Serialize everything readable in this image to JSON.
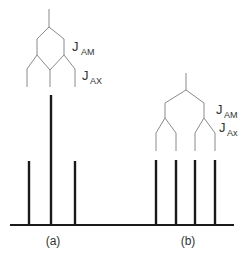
{
  "figure": {
    "panels": [
      {
        "id": "a",
        "caption": "(a)",
        "splitting_labels": [
          {
            "main": "J",
            "sub": "AM"
          },
          {
            "main": "J",
            "sub": "AX"
          }
        ],
        "lines": [
          {
            "x": 29,
            "relative_intensity": 1
          },
          {
            "x": 51,
            "relative_intensity": 2
          },
          {
            "x": 75,
            "relative_intensity": 1
          }
        ]
      },
      {
        "id": "b",
        "caption": "(b)",
        "splitting_labels": [
          {
            "main": "J",
            "sub": "AM"
          },
          {
            "main": "J",
            "sub": "Ax"
          }
        ],
        "lines": [
          {
            "x": 156,
            "relative_intensity": 1
          },
          {
            "x": 176,
            "relative_intensity": 1
          },
          {
            "x": 195,
            "relative_intensity": 1
          },
          {
            "x": 215,
            "relative_intensity": 1
          }
        ]
      }
    ],
    "colors": {
      "tree_lines": "#8a8a8a",
      "sticks": "#1a1a1a",
      "text": "#333333",
      "background": "#ffffff"
    }
  }
}
